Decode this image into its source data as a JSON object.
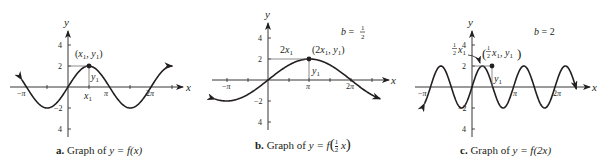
{
  "graphs": [
    {
      "id": "a",
      "caption_letter": "a.",
      "caption_text": "Graph of ",
      "caption_eq": "y = f(x)",
      "point_label": "(x1, y1)",
      "x_tick_labels": [
        "−π",
        "x1",
        "π",
        "2π"
      ],
      "y_tick_labels": [
        "4",
        "2",
        "−2",
        "4"
      ],
      "axis_x_label": "x",
      "axis_y_label": "y",
      "segment_labels": [
        "y1"
      ]
    },
    {
      "id": "b",
      "caption_letter": "b.",
      "caption_text": "Graph of ",
      "caption_eq": "y = f",
      "caption_frac": [
        "1",
        "2"
      ],
      "caption_tail": "x",
      "b_value_label": "b =",
      "b_value_frac": [
        "1",
        "2"
      ],
      "point_label": "(2x1, y1)",
      "horizontal_label": "2x1",
      "x_tick_labels": [
        "−π",
        "π",
        "2π"
      ],
      "y_tick_labels": [
        "4",
        "2",
        "−2",
        "4"
      ],
      "axis_x_label": "x",
      "axis_y_label": "y",
      "segment_labels": [
        "y1"
      ]
    },
    {
      "id": "c",
      "caption_letter": "c.",
      "caption_text": "Graph of ",
      "caption_eq": "y = f(2x)",
      "b_value_label": "b = 2",
      "point_label": "(½x1, y1)",
      "horizontal_label": "½x1",
      "x_tick_labels": [
        "−π",
        "π",
        "2π"
      ],
      "y_tick_labels": [
        "4",
        "2",
        "−2",
        "4"
      ],
      "axis_x_label": "x",
      "axis_y_label": "y",
      "segment_labels": [
        "y1"
      ]
    }
  ],
  "chart_data": [
    {
      "type": "line",
      "title": "a. Graph of y = f(x)",
      "function": "y = 2 sin(x)",
      "x_range": [
        -3.5,
        7.9
      ],
      "ylim": [
        -4.5,
        5
      ],
      "xticks": [
        "-π",
        "π/2 (x1)",
        "π",
        "2π"
      ],
      "yticks": [
        4,
        2,
        -2,
        -4
      ],
      "annotated_point": {
        "label": "(x1, y1)",
        "x": 1.5708,
        "y": 2
      },
      "xlabel": "x",
      "ylabel": "y"
    },
    {
      "type": "line",
      "title": "b. Graph of y = f(½x)",
      "function": "y = 2 sin(x/2)",
      "annotation": "b = 1/2",
      "x_range": [
        -4.0,
        8.5
      ],
      "ylim": [
        -4.5,
        5
      ],
      "xticks": [
        "-π",
        "π",
        "2π"
      ],
      "yticks": [
        4,
        2,
        -2,
        -4
      ],
      "annotated_point": {
        "label": "(2x1, y1)",
        "x": 3.1416,
        "y": 2
      },
      "xlabel": "x",
      "ylabel": "y"
    },
    {
      "type": "line",
      "title": "c. Graph of y = f(2x)",
      "function": "y = 2 sin(2x)",
      "annotation": "b = 2",
      "x_range": [
        -3.6,
        7.9
      ],
      "ylim": [
        -4.5,
        5
      ],
      "xticks": [
        "-π",
        "π",
        "2π"
      ],
      "yticks": [
        4,
        2,
        -2,
        -4
      ],
      "annotated_point": {
        "label": "(½x1, y1)",
        "x": 0.7854,
        "y": 2
      },
      "xlabel": "x",
      "ylabel": "y"
    }
  ],
  "colors": {
    "ink": "#231f20",
    "guide": "#6d6e71",
    "background": "#ffffff"
  }
}
